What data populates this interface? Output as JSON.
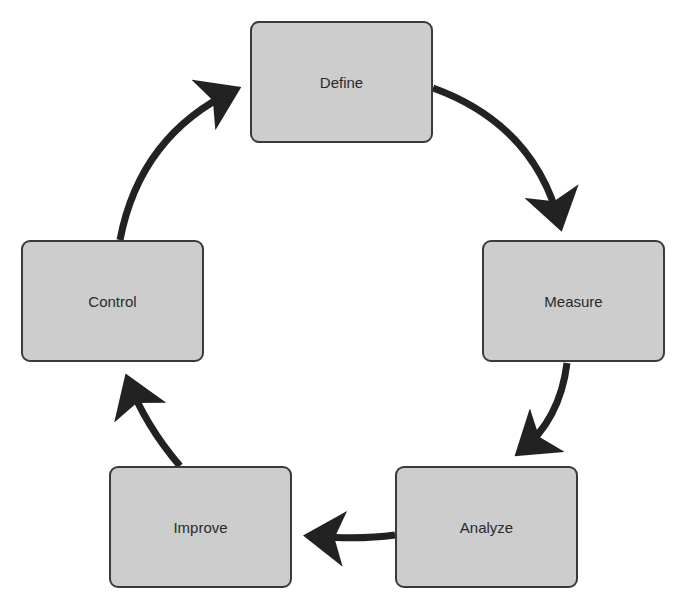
{
  "diagram": {
    "type": "cycle",
    "colors": {
      "box_fill": "#cdcdcd",
      "box_border": "#3a3a3a",
      "arrow": "#222222",
      "text": "#2a2a2a"
    },
    "steps": [
      {
        "label": "Define"
      },
      {
        "label": "Measure"
      },
      {
        "label": "Analyze"
      },
      {
        "label": "Improve"
      },
      {
        "label": "Control"
      }
    ],
    "arrows": [
      {
        "from": "Define",
        "to": "Measure"
      },
      {
        "from": "Measure",
        "to": "Analyze"
      },
      {
        "from": "Analyze",
        "to": "Improve"
      },
      {
        "from": "Improve",
        "to": "Control"
      },
      {
        "from": "Control",
        "to": "Define"
      }
    ]
  }
}
